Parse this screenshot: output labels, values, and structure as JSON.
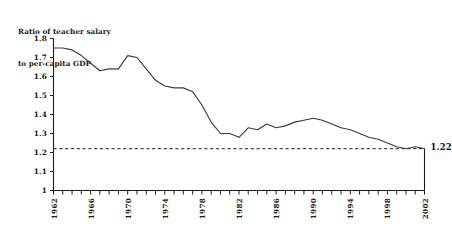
{
  "chart_data": {
    "type": "line",
    "title": "Ratio of teacher salary to per-capita GDP",
    "title_lines": [
      "Ratio of teacher salary",
      "to per-capita GDP"
    ],
    "xlabel": "",
    "ylabel": "",
    "xlim": [
      1962,
      2002
    ],
    "ylim": [
      1,
      1.8
    ],
    "grid": false,
    "legend": "none",
    "y_ticks": [
      1,
      1.1,
      1.2,
      1.3,
      1.4,
      1.5,
      1.6,
      1.7,
      1.8
    ],
    "y_tick_labels": [
      "1",
      "1.1",
      "1.2",
      "1.3",
      "1.4",
      "1.5",
      "1.6",
      "1.7",
      "1.8"
    ],
    "x_ticks_minor_step": 1,
    "x_tick_labels": [
      "1962",
      "1966",
      "1970",
      "1974",
      "1978",
      "1982",
      "1986",
      "1990",
      "1994",
      "1998",
      "2002"
    ],
    "x_tick_label_years": [
      1962,
      1966,
      1970,
      1974,
      1978,
      1982,
      1986,
      1990,
      1994,
      1998,
      2002
    ],
    "x": [
      1962,
      1963,
      1964,
      1965,
      1966,
      1967,
      1968,
      1969,
      1970,
      1971,
      1972,
      1973,
      1974,
      1975,
      1976,
      1977,
      1978,
      1979,
      1980,
      1981,
      1982,
      1983,
      1984,
      1985,
      1986,
      1987,
      1988,
      1989,
      1990,
      1991,
      1992,
      1993,
      1994,
      1995,
      1996,
      1997,
      1998,
      1999,
      2000,
      2001,
      2002
    ],
    "values": [
      1.75,
      1.75,
      1.74,
      1.71,
      1.67,
      1.63,
      1.64,
      1.64,
      1.71,
      1.7,
      1.64,
      1.58,
      1.55,
      1.54,
      1.54,
      1.52,
      1.45,
      1.36,
      1.3,
      1.3,
      1.28,
      1.33,
      1.32,
      1.35,
      1.33,
      1.34,
      1.36,
      1.37,
      1.38,
      1.37,
      1.35,
      1.33,
      1.32,
      1.3,
      1.28,
      1.27,
      1.25,
      1.23,
      1.22,
      1.23,
      1.22
    ],
    "reference_line": {
      "value": 1.22,
      "style": "dashed",
      "label": "1.22"
    },
    "endpoint_annotation": {
      "label": "1.22",
      "year": 2002,
      "value": 1.22
    },
    "colors": {
      "line": "#3b3b3b",
      "axis": "#1a1a1a",
      "reference": "#1a1a1a",
      "background": "#ffffff",
      "text": "#1a1a1a"
    }
  }
}
